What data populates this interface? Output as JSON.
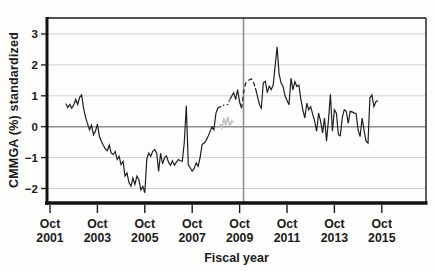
{
  "figure": {
    "background": "#fdfdfc",
    "line_color": "#1f1f1f",
    "grid_color": "#d0d0d0",
    "ref_line_color": "#8f8f8f",
    "overlay_color": "#bdbdbd",
    "text_color": "#1a1a1a"
  },
  "chart_data": {
    "type": "line",
    "title": "",
    "xlabel": "Fiscal year",
    "ylabel": "CMMGA (%) standardized",
    "x_ticks": [
      {
        "month": "Oct",
        "year": "2001",
        "month_index": 0
      },
      {
        "month": "Oct",
        "year": "2003",
        "month_index": 24
      },
      {
        "month": "Oct",
        "year": "2005",
        "month_index": 48
      },
      {
        "month": "Oct",
        "year": "2007",
        "month_index": 72
      },
      {
        "month": "Oct",
        "year": "2009",
        "month_index": 96
      },
      {
        "month": "Oct",
        "year": "2011",
        "month_index": 120
      },
      {
        "month": "Oct",
        "year": "2013",
        "month_index": 144
      },
      {
        "month": "Oct",
        "year": "2015",
        "month_index": 168
      }
    ],
    "y_ticks": [
      {
        "label": "3",
        "value": 3
      },
      {
        "label": "2",
        "value": 2
      },
      {
        "label": "1",
        "value": 1
      },
      {
        "label": "0",
        "value": 0
      },
      {
        "label": "−1",
        "value": -1
      },
      {
        "label": "−2",
        "value": -2
      }
    ],
    "ylim": [
      -2.47,
      3.5
    ],
    "xlim_months": [
      -1.5,
      190
    ],
    "grid": "horizontal light gray at each integer",
    "legend": "none",
    "reference_lines": [
      {
        "axis": "y",
        "value": 0
      },
      {
        "axis": "x",
        "value_month": 98
      }
    ],
    "series": [
      {
        "name": "cmmga-standardized-monthly",
        "color": "#1f1f1f",
        "start_month": 8,
        "style_segments": [
          {
            "start": 8,
            "end": 86,
            "style": "solid"
          },
          {
            "start": 86,
            "end": 91,
            "style": "dotted"
          },
          {
            "start": 91,
            "end": 97,
            "style": "solid"
          },
          {
            "start": 97,
            "end": 104,
            "style": "dashed"
          },
          {
            "start": 104,
            "end": 166,
            "style": "solid"
          }
        ],
        "values": [
          0.75,
          0.62,
          0.72,
          0.6,
          0.7,
          0.88,
          0.72,
          0.95,
          1.03,
          0.6,
          0.3,
          0.1,
          -0.1,
          0.05,
          -0.26,
          -0.15,
          0.08,
          -0.31,
          -0.47,
          -0.6,
          -0.72,
          -0.78,
          -0.6,
          -0.85,
          -0.9,
          -0.8,
          -1.06,
          -0.96,
          -1.23,
          -1.12,
          -1.6,
          -1.5,
          -1.81,
          -1.93,
          -1.66,
          -1.87,
          -1.6,
          -1.72,
          -2.05,
          -1.93,
          -2.14,
          -1.05,
          -0.85,
          -0.96,
          -0.8,
          -0.74,
          -0.85,
          -1.45,
          -0.86,
          -1.2,
          -1.0,
          -0.95,
          -1.15,
          -1.25,
          -1.1,
          -1.25,
          -1.15,
          -1.06,
          -1.1,
          -1.12,
          -0.5,
          0.68,
          -1.23,
          -1.33,
          -1.44,
          -1.35,
          -1.17,
          -1.28,
          -1.0,
          -0.58,
          -0.53,
          -0.45,
          -0.32,
          -0.16,
          0.0,
          -0.1,
          0.43,
          0.6,
          0.65,
          0.62,
          0.7,
          0.72,
          0.72,
          0.88,
          0.99,
          1.1,
          0.88,
          1.2,
          0.8,
          0.6,
          1.1,
          1.4,
          1.47,
          1.52,
          1.55,
          1.45,
          1.26,
          0.99,
          0.72,
          0.6,
          1.42,
          1.47,
          1.1,
          1.31,
          1.2,
          1.35,
          1.95,
          2.59,
          1.7,
          1.41,
          1.3,
          1.0,
          0.85,
          0.71,
          1.57,
          1.19,
          1.46,
          1.3,
          1.35,
          0.9,
          0.55,
          0.28,
          0.76,
          0.55,
          0.65,
          0.4,
          0.17,
          -0.15,
          0.44,
          0.17,
          -0.2,
          0.28,
          -0.47,
          0.22,
          1.05,
          -0.15,
          0.55,
          0.44,
          -0.26,
          -0.29,
          0.3,
          0.55,
          0.5,
          0.11,
          0.5,
          0.48,
          0.44,
          0.43,
          -0.1,
          -0.32,
          0.28,
          -0.1,
          -0.47,
          -0.53,
          0.93,
          1.03,
          0.65,
          0.81,
          0.85
        ]
      },
      {
        "name": "overlay-gray-segment",
        "color": "#bdbdbd",
        "start_month": 86,
        "style_segments": [
          {
            "start": 86,
            "end": 93,
            "style": "solid"
          }
        ],
        "values": [
          0.1,
          -0.05,
          0.28,
          0.05,
          0.32,
          0.0,
          0.18,
          0.15
        ]
      }
    ]
  }
}
